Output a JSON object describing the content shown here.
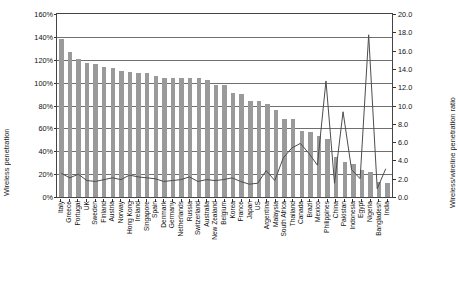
{
  "chart_data": {
    "type": "bar",
    "title": "",
    "xlabel": "",
    "ylabel": "Wireless penetration",
    "ylabel_secondary": "Wireless/wireline penetration ratio",
    "ylim": [
      0,
      160
    ],
    "ylim_secondary": [
      0,
      20
    ],
    "yticks": [
      "0%",
      "20%",
      "40%",
      "60%",
      "80%",
      "100%",
      "120%",
      "140%",
      "160%"
    ],
    "ytick_values": [
      0,
      20,
      40,
      60,
      80,
      100,
      120,
      140,
      160
    ],
    "yticks_secondary": [
      "0.0",
      "2.0",
      "4.0",
      "6.0",
      "8.0",
      "10.0",
      "12.0",
      "14.0",
      "16.0",
      "18.0",
      "20.0"
    ],
    "ytick_values_secondary": [
      0,
      2,
      4,
      6,
      8,
      10,
      12,
      14,
      16,
      18,
      20
    ],
    "grid": true,
    "legend": "none",
    "bar_color": "#9a9a9a",
    "line_color": "#4d4d4d",
    "categories": [
      "Italy",
      "Greece",
      "Portugal",
      "UK",
      "Sweden",
      "Finland",
      "Austria",
      "Norway",
      "Hong Kong",
      "Ireland",
      "Singapore",
      "Spain",
      "Denmark",
      "Germany",
      "Netherlands",
      "Russia",
      "Switzerland",
      "Australia",
      "New Zealand",
      "Belgium",
      "Korea",
      "France",
      "Japan",
      "US",
      "Argentina",
      "Malaysia",
      "South Africa",
      "Thailand",
      "Canada",
      "Brazil",
      "Mexico",
      "Philippines",
      "China",
      "Pakistan",
      "Indonesia",
      "Egypt",
      "Nigeria",
      "Bangladesh",
      "India"
    ],
    "series": [
      {
        "name": "Wireless penetration",
        "type": "bar",
        "axis": "left",
        "unit": "%",
        "values": [
          138,
          127,
          121,
          117,
          116,
          114,
          113,
          110,
          109,
          108,
          108,
          106,
          104,
          104,
          104,
          104,
          104,
          102,
          98,
          98,
          91,
          90,
          84,
          84,
          81,
          76,
          68,
          68,
          58,
          57,
          53,
          51,
          35,
          31,
          29,
          24,
          22,
          13,
          12
        ]
      },
      {
        "name": "Wireless/wireline penetration ratio",
        "type": "line",
        "axis": "right",
        "values": [
          2.4,
          1.9,
          2.3,
          1.6,
          1.5,
          1.7,
          1.9,
          1.7,
          2.2,
          2.0,
          1.9,
          1.8,
          1.5,
          1.6,
          1.7,
          2.0,
          1.5,
          1.7,
          1.6,
          1.7,
          1.9,
          1.5,
          1.2,
          1.3,
          2.7,
          1.6,
          4.1,
          5.2,
          5.7,
          4.6,
          3.3,
          12.6,
          1.3,
          9.2,
          2.8,
          1.8,
          17.7,
          0.7,
          2.9
        ]
      }
    ]
  }
}
